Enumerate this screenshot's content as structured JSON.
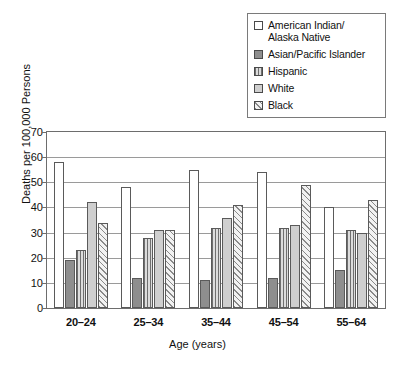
{
  "chart_data": {
    "type": "bar",
    "title": "",
    "xlabel": "Age (years)",
    "ylabel": "Deaths per 100,000 Persons",
    "categories": [
      "20–24",
      "25–34",
      "35–44",
      "45–54",
      "55–64"
    ],
    "ylim": [
      0,
      70
    ],
    "yticks": [
      0,
      10,
      20,
      30,
      40,
      50,
      60,
      70
    ],
    "grid": true,
    "legend_position": "top-right",
    "series": [
      {
        "name": "American Indian/\nAlaska Native",
        "pattern": "white",
        "values": [
          58,
          48,
          55,
          54,
          40
        ]
      },
      {
        "name": "Asian/Pacific Islander",
        "pattern": "dark",
        "values": [
          19,
          12,
          11,
          12,
          15
        ]
      },
      {
        "name": "Hispanic",
        "pattern": "stripe",
        "values": [
          23,
          28,
          32,
          32,
          31
        ]
      },
      {
        "name": "White",
        "pattern": "light",
        "values": [
          42,
          31,
          36,
          33,
          30
        ]
      },
      {
        "name": "Black",
        "pattern": "hatch",
        "values": [
          34,
          31,
          41,
          49,
          43
        ]
      }
    ]
  }
}
